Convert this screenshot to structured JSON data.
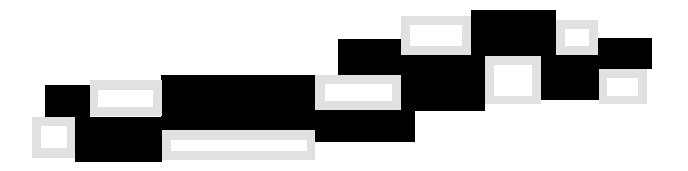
{
  "graphic": {
    "background": "#ffffff",
    "block_color": "#000000",
    "frame_color": "#e1e1e1",
    "frame_inner_color": "#ffffff",
    "black_blocks": [
      {
        "x": 45,
        "y": 85,
        "w": 45,
        "h": 32
      },
      {
        "x": 75,
        "y": 117,
        "w": 87,
        "h": 45
      },
      {
        "x": 161,
        "y": 75,
        "w": 155,
        "h": 55
      },
      {
        "x": 315,
        "y": 110,
        "w": 100,
        "h": 32
      },
      {
        "x": 338,
        "y": 39,
        "w": 64,
        "h": 36
      },
      {
        "x": 401,
        "y": 55,
        "w": 84,
        "h": 56
      },
      {
        "x": 471,
        "y": 10,
        "w": 85,
        "h": 46
      },
      {
        "x": 541,
        "y": 55,
        "w": 58,
        "h": 45
      },
      {
        "x": 598,
        "y": 38,
        "w": 54,
        "h": 31
      },
      {
        "x": 300,
        "y": 75,
        "w": 16,
        "h": 55
      }
    ],
    "gray_frames": [
      {
        "x": 90,
        "y": 80,
        "w": 72,
        "h": 36,
        "ix": 8,
        "iy": 10,
        "iw": 55,
        "ih": 17
      },
      {
        "x": 32,
        "y": 117,
        "w": 43,
        "h": 41,
        "ix": 9,
        "iy": 9,
        "iw": 26,
        "ih": 22
      },
      {
        "x": 162,
        "y": 130,
        "w": 153,
        "h": 30,
        "ix": 9,
        "iy": 10,
        "iw": 136,
        "ih": 11
      },
      {
        "x": 315,
        "y": 75,
        "w": 86,
        "h": 35,
        "ix": 10,
        "iy": 9,
        "iw": 67,
        "ih": 17
      },
      {
        "x": 401,
        "y": 16,
        "w": 70,
        "h": 39,
        "ix": 9,
        "iy": 9,
        "iw": 52,
        "ih": 21
      },
      {
        "x": 556,
        "y": 20,
        "w": 42,
        "h": 35,
        "ix": 9,
        "iy": 9,
        "iw": 24,
        "ih": 17
      },
      {
        "x": 485,
        "y": 56,
        "w": 56,
        "h": 48,
        "ix": 9,
        "iy": 9,
        "iw": 38,
        "ih": 31
      },
      {
        "x": 599,
        "y": 69,
        "w": 48,
        "h": 35,
        "ix": 8,
        "iy": 9,
        "iw": 31,
        "ih": 18
      }
    ]
  }
}
